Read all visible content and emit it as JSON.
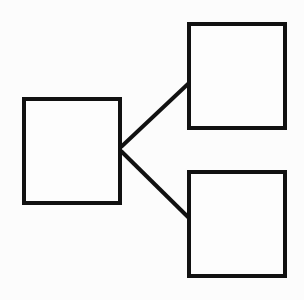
{
  "diagram": {
    "type": "tree",
    "stroke_color": "#111111",
    "background_color": "#fcfcfc",
    "stroke_width": 4,
    "nodes": [
      {
        "id": "root",
        "label": "",
        "x": 24,
        "y": 99,
        "width": 96,
        "height": 104
      },
      {
        "id": "child-top",
        "label": "",
        "x": 189,
        "y": 24,
        "width": 96,
        "height": 104
      },
      {
        "id": "child-bottom",
        "label": "",
        "x": 189,
        "y": 172,
        "width": 96,
        "height": 104
      }
    ],
    "edges": [
      {
        "from": "root",
        "to": "child-top",
        "x1": 121,
        "y1": 147,
        "x2": 189,
        "y2": 83
      },
      {
        "from": "root",
        "to": "child-bottom",
        "x1": 121,
        "y1": 151,
        "x2": 189,
        "y2": 218
      }
    ]
  }
}
